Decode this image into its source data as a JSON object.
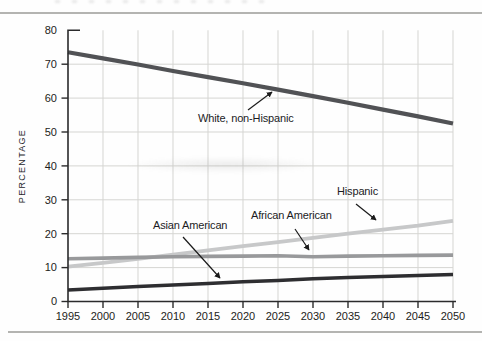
{
  "figure": {
    "ylabel": "PERCENTAGE"
  },
  "chart_data": {
    "type": "line",
    "title": "",
    "xlabel": "",
    "ylabel": "PERCENTAGE",
    "xlim": [
      1995,
      2050
    ],
    "ylim": [
      0,
      80
    ],
    "grid": true,
    "legend_position": "none (inline text annotations with arrows)",
    "x": [
      1995,
      2000,
      2005,
      2010,
      2015,
      2020,
      2025,
      2030,
      2035,
      2040,
      2045,
      2050
    ],
    "x_tick_labels": [
      "1995",
      "2000",
      "2005",
      "2010",
      "2015",
      "2020",
      "2025",
      "2030",
      "2035",
      "2040",
      "2045",
      "2050"
    ],
    "y_ticks": [
      0,
      10,
      20,
      30,
      40,
      50,
      60,
      70,
      80
    ],
    "series": [
      {
        "name": "White, non-Hispanic",
        "color": "#515255",
        "line_width": 4.2,
        "values": [
          73.5,
          71.7,
          69.9,
          68.0,
          66.2,
          64.4,
          62.5,
          60.6,
          58.6,
          56.6,
          54.6,
          52.5
        ]
      },
      {
        "name": "Hispanic",
        "color": "#c7c8c9",
        "line_width": 3.8,
        "values": [
          10.3,
          11.4,
          12.6,
          13.8,
          15.1,
          16.3,
          17.5,
          18.8,
          20.0,
          21.2,
          22.4,
          23.8
        ]
      },
      {
        "name": "African American",
        "color": "#98999b",
        "line_width": 3.6,
        "values": [
          12.6,
          12.8,
          13.0,
          13.2,
          13.3,
          13.4,
          13.5,
          13.2,
          13.4,
          13.5,
          13.6,
          13.7
        ]
      },
      {
        "name": "Asian American",
        "color": "#2e2e31",
        "line_width": 3.5,
        "values": [
          3.4,
          3.9,
          4.4,
          4.9,
          5.3,
          5.8,
          6.2,
          6.7,
          7.1,
          7.4,
          7.7,
          8.0
        ]
      }
    ],
    "annotations": [
      {
        "label": "White, non-Hispanic"
      },
      {
        "label": "Asian American"
      },
      {
        "label": "African American"
      },
      {
        "label": "Hispanic"
      }
    ],
    "colors": {
      "axis": "#2b2b2c",
      "gridline": "#d5d5d2",
      "tick_text": "#1d1d20",
      "arrow": "#1a1a1a",
      "page_rule": "#b4b4b1"
    }
  }
}
